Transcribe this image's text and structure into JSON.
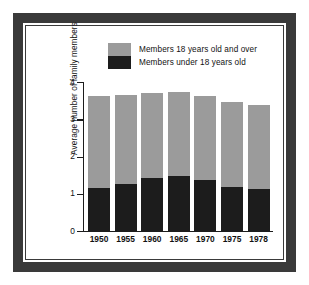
{
  "chart_data": {
    "type": "bar",
    "subtype": "stacked-vertical",
    "title": "",
    "xlabel": "",
    "ylabel": "Average number of family members",
    "categories": [
      "1950",
      "1955",
      "1960",
      "1965",
      "1970",
      "1975",
      "1978"
    ],
    "series": [
      {
        "name": "Members under 18 years old",
        "color": "#1c1c1c",
        "values": [
          1.15,
          1.26,
          1.42,
          1.47,
          1.37,
          1.18,
          1.13
        ]
      },
      {
        "name": "Members 18 years old and over",
        "color": "#9b9b9b",
        "values": [
          2.47,
          2.39,
          2.28,
          2.26,
          2.25,
          2.28,
          2.25
        ]
      }
    ],
    "totals": [
      3.62,
      3.65,
      3.7,
      3.73,
      3.62,
      3.46,
      3.38
    ],
    "ylim": [
      0,
      4
    ],
    "yticks": [
      "0",
      "1",
      "2",
      "3",
      "4"
    ],
    "ytick_values": [
      0,
      1,
      2,
      3,
      4
    ],
    "grid": false,
    "legend_position": "top-center",
    "stack_order": [
      "Members under 18 years old",
      "Members 18 years old and over"
    ]
  },
  "legend": {
    "items": [
      {
        "label": "Members 18 years old and over",
        "swatch": "over18"
      },
      {
        "label": "Members under 18 years old",
        "swatch": "under18"
      }
    ]
  },
  "colors": {
    "frame": "#3a3a3a",
    "over18": "#9b9b9b",
    "under18": "#1c1c1c",
    "axis": "#1c1c1c",
    "background": "#ffffff"
  }
}
